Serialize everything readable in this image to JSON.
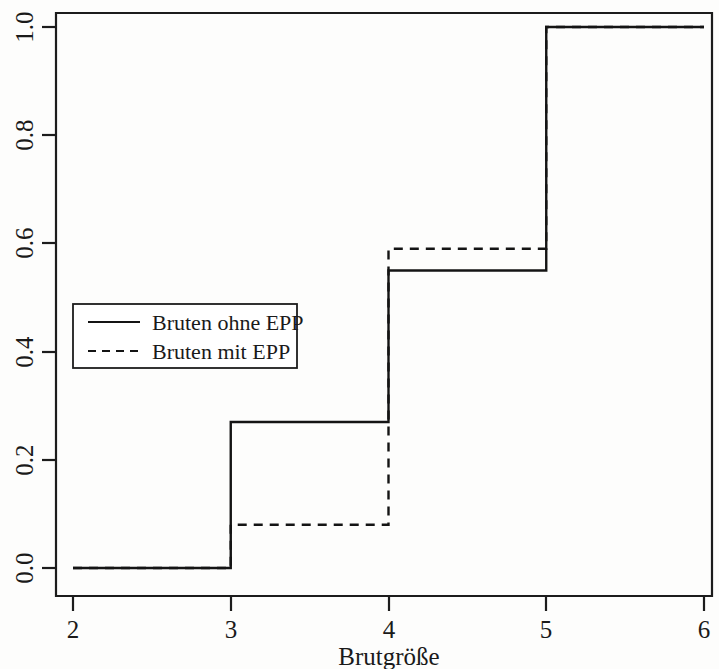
{
  "chart_data": {
    "type": "line",
    "title": "",
    "subtitle": "",
    "xlabel": "Brutgröße",
    "ylabel": "",
    "xlim": [
      2,
      6
    ],
    "ylim": [
      0.0,
      1.0
    ],
    "grid": false,
    "legend_position": "center-left",
    "x_ticks": [
      2,
      3,
      4,
      5,
      6
    ],
    "x_tick_labels": [
      "2",
      "3",
      "4",
      "5",
      "6"
    ],
    "y_ticks": [
      0.0,
      0.2,
      0.4,
      0.6,
      0.8,
      1.0
    ],
    "y_tick_labels": [
      "0.0",
      "0.2",
      "0.4",
      "0.6",
      "0.8",
      "1.0"
    ],
    "interpolation": "step-post",
    "annotations": [],
    "series": [
      {
        "name": "Bruten ohne EPP",
        "style": "solid",
        "color": "#141414",
        "x": [
          2,
          3,
          4,
          5,
          6
        ],
        "values": [
          0.0,
          0.27,
          0.55,
          1.0,
          1.0
        ]
      },
      {
        "name": "Bruten mit EPP",
        "style": "dashed",
        "color": "#141414",
        "x": [
          2,
          3,
          4,
          5,
          6
        ],
        "values": [
          0.0,
          0.08,
          0.59,
          1.0,
          1.0
        ]
      }
    ]
  },
  "axes": {
    "x_title": "Brutgröße",
    "x_tick_labels": [
      "2",
      "3",
      "4",
      "5",
      "6"
    ],
    "y_tick_labels": [
      "0.0",
      "0.2",
      "0.4",
      "0.6",
      "0.8",
      "1.0"
    ]
  },
  "legend": {
    "entries": [
      {
        "label": "Bruten ohne EPP",
        "style": "solid"
      },
      {
        "label": "Bruten mit EPP",
        "style": "dashed"
      }
    ]
  }
}
